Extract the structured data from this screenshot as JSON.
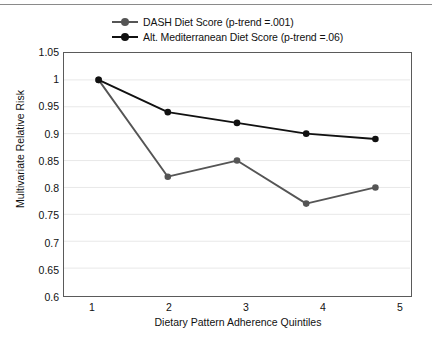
{
  "chart_data": {
    "type": "line",
    "title": "",
    "xlabel": "Dietary Pattern Adherence Quintiles",
    "ylabel": "Multivariate Relative Risk",
    "categories": [
      "1",
      "2",
      "3",
      "4",
      "5"
    ],
    "x": [
      1,
      2,
      3,
      4,
      5
    ],
    "xlim": [
      0.5,
      5.5
    ],
    "ylim": [
      0.6,
      1.05
    ],
    "yticks": [
      "0.6",
      "0.65",
      "0.7",
      "0.75",
      "0.8",
      "0.85",
      "0.9",
      "0.95",
      "1",
      "1.05"
    ],
    "ytick_values": [
      0.6,
      0.65,
      0.7,
      0.75,
      0.8,
      0.85,
      0.9,
      0.95,
      1.0,
      1.05
    ],
    "grid": true,
    "grid_axis": "y",
    "legend_position": "top",
    "series": [
      {
        "name": "DASH Diet Score (p-trend =.001)",
        "short_name": "DASH Diet Score",
        "p_trend": "(p-trend =.001)",
        "color": "#555555",
        "values": [
          1.0,
          0.82,
          0.85,
          0.77,
          0.8
        ]
      },
      {
        "name": "Alt. Mediterranean Diet Score (p-trend =.06)",
        "short_name": "Alt. Mediterranean Diet Score",
        "p_trend": "(p-trend =.06)",
        "color": "#111111",
        "values": [
          1.0,
          0.94,
          0.92,
          0.9,
          0.89
        ]
      }
    ]
  },
  "legend": {
    "items": [
      {
        "label": "DASH Diet Score (p-trend =.001)",
        "color": "#555555"
      },
      {
        "label": "Alt. Mediterranean Diet Score (p-trend =.06)",
        "color": "#111111"
      }
    ]
  },
  "axes": {
    "y_title": "Multivariate Relative Risk",
    "x_title": "Dietary Pattern Adherence Quintiles",
    "y_tick_labels": [
      "1.05",
      "1",
      "0.95",
      "0.9",
      "0.85",
      "0.8",
      "0.75",
      "0.7",
      "0.65",
      "0.6"
    ],
    "x_tick_labels": [
      "1",
      "2",
      "3",
      "4",
      "5"
    ]
  },
  "colors": {
    "frame": "#5a5a5a",
    "grid": "#e8e8e8",
    "series_1": "#555555",
    "series_2": "#111111",
    "text": "#111111",
    "top_rule": "#8a8a8a"
  }
}
